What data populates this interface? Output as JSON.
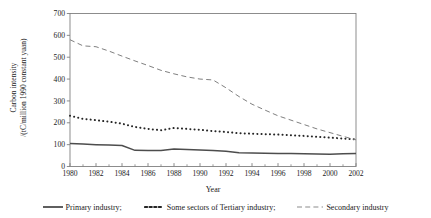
{
  "chart_data": {
    "type": "line",
    "title": "",
    "xlabel": "Year",
    "ylabel_lines": [
      "Carbon intensity",
      "/(tC/million 1990 constant yuan)"
    ],
    "ylabel": "Carbon intensity /(tC/million 1990 constant yuan)",
    "xlim": [
      1980,
      2002
    ],
    "ylim": [
      0,
      700
    ],
    "ytick_labels": [
      "0",
      "100",
      "200",
      "300",
      "400",
      "500",
      "600",
      "700"
    ],
    "yticks": [
      0,
      100,
      200,
      300,
      400,
      500,
      600,
      700
    ],
    "xtick_labels": [
      "1980",
      "1982",
      "1984",
      "1986",
      "1988",
      "1990",
      "1992",
      "1994",
      "1996",
      "1998",
      "2000",
      "2002"
    ],
    "xticks": [
      1980,
      1982,
      1984,
      1986,
      1988,
      1990,
      1992,
      1994,
      1996,
      1998,
      2000,
      2002
    ],
    "x_minor_ticks": [
      1981,
      1983,
      1985,
      1987,
      1989,
      1991,
      1993,
      1995,
      1997,
      1999,
      2001
    ],
    "grid": false,
    "legend_position": "below",
    "x": [
      1980,
      1981,
      1982,
      1983,
      1984,
      1985,
      1986,
      1987,
      1988,
      1989,
      1990,
      1991,
      1992,
      1993,
      1994,
      1995,
      1996,
      1997,
      1998,
      1999,
      2000,
      2001,
      2002
    ],
    "series": [
      {
        "name": "Primary industry;",
        "style": "solid",
        "color": "#4d4d4d",
        "values": [
          105,
          103,
          100,
          98,
          96,
          74,
          73,
          73,
          80,
          78,
          76,
          73,
          70,
          63,
          62,
          61,
          60,
          59,
          58,
          57,
          56,
          58,
          60
        ]
      },
      {
        "name": "Some sectors of Tertiary industry;",
        "style": "dotted",
        "color": "#262626",
        "values": [
          232,
          218,
          212,
          205,
          196,
          181,
          172,
          166,
          176,
          172,
          168,
          162,
          158,
          152,
          150,
          148,
          146,
          143,
          140,
          136,
          132,
          128,
          124
        ]
      },
      {
        "name": "Secondary industry",
        "style": "dashed",
        "color": "#808080",
        "values": [
          580,
          552,
          548,
          528,
          505,
          483,
          462,
          440,
          424,
          410,
          400,
          396,
          360,
          320,
          285,
          258,
          232,
          212,
          192,
          172,
          155,
          138,
          122
        ]
      }
    ]
  },
  "axes": {
    "frame_color": "#808080"
  }
}
